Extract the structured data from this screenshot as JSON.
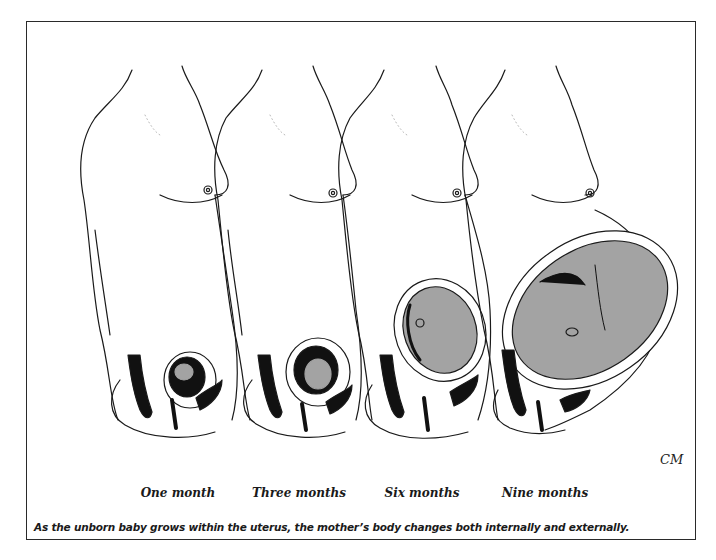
{
  "figure": {
    "stages": [
      {
        "label": "One month",
        "x": 178
      },
      {
        "label": "Three months",
        "x": 299
      },
      {
        "label": "Six months",
        "x": 422
      },
      {
        "label": "Nine months",
        "x": 545
      }
    ],
    "caption": "As the unborn baby grows within the uterus, the mother’s body changes both internally and externally.",
    "artist_signature": "CM",
    "colors": {
      "line": "#1a1a1a",
      "fetus_fill": "#a3a3a3",
      "organ_fill": "#111111",
      "frame": "#2a2a2a"
    }
  }
}
